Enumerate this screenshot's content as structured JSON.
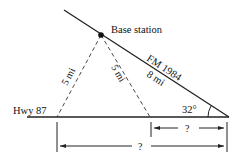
{
  "diagram": {
    "base_station_label": "Base station",
    "road_fm_label": "FM 1984",
    "fm_distance_label": "8 mi",
    "hwy_label": "Hwy 87",
    "dashed_left_label": "5 mi",
    "dashed_right_label": "5 mi",
    "angle_label": "32°",
    "short_unknown_label": "?",
    "long_unknown_label": "?"
  }
}
